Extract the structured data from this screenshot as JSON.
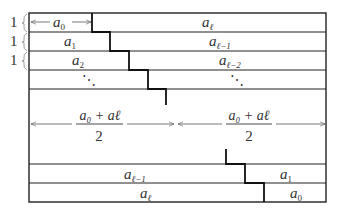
{
  "diagram": {
    "row_counts": [
      "1",
      "1",
      "1"
    ],
    "top_rows": [
      {
        "left": "a",
        "left_sub": "0",
        "right": "a",
        "right_sub": "ℓ"
      },
      {
        "left": "a",
        "left_sub": "1",
        "right": "a",
        "right_sub": "ℓ−1"
      },
      {
        "left": "a",
        "left_sub": "2",
        "right": "a",
        "right_sub": "ℓ−2"
      },
      {
        "left": "⋱",
        "left_sub": "",
        "right": "⋱",
        "right_sub": ""
      }
    ],
    "middle": {
      "left_numerator": "a₀ + aℓ",
      "left_denominator": "2",
      "right_numerator": "a₀ + aℓ",
      "right_denominator": "2"
    },
    "bottom_rows": [
      {
        "left": "a",
        "left_sub": "ℓ−1",
        "right": "a",
        "right_sub": "1"
      },
      {
        "left": "a",
        "left_sub": "ℓ",
        "right": "a",
        "right_sub": "0"
      }
    ],
    "colors": {
      "line": "#222222",
      "thin_line": "#555555",
      "background": "#ffffff"
    }
  }
}
